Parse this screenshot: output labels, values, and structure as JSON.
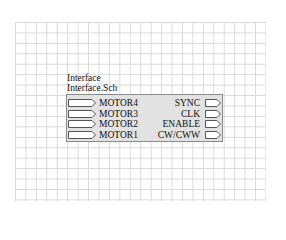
{
  "sheet_symbol": {
    "designator": "Interface",
    "filename": "Interface.Sch",
    "left_ports": [
      {
        "name": "MOTOR4"
      },
      {
        "name": "MOTOR3"
      },
      {
        "name": "MOTOR2"
      },
      {
        "name": "MOTOR1"
      }
    ],
    "right_ports": [
      {
        "name": "SYNC"
      },
      {
        "name": "CLK"
      },
      {
        "name": "ENABLE"
      },
      {
        "name": "CW/CWW"
      }
    ],
    "colors": {
      "fill": "#e2e2e2",
      "border": "#8a8a8a",
      "grid": "#d9d9d9"
    }
  }
}
